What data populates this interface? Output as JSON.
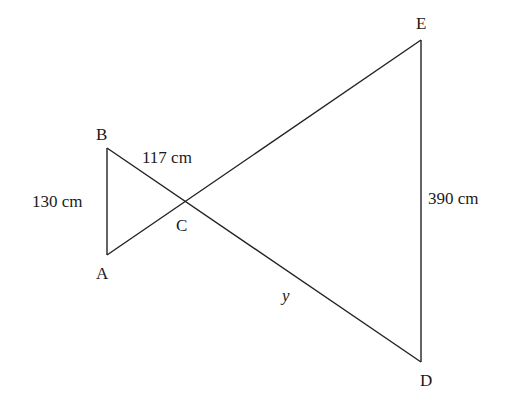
{
  "diagram": {
    "type": "similar-triangles",
    "points": {
      "A": {
        "label": "A",
        "x": 107,
        "y": 255
      },
      "B": {
        "label": "B",
        "x": 107,
        "y": 148
      },
      "C": {
        "label": "C",
        "x": 184,
        "y": 202
      },
      "D": {
        "label": "D",
        "x": 421,
        "y": 362
      },
      "E": {
        "label": "E",
        "x": 421,
        "y": 40
      }
    },
    "segments": [
      {
        "name": "AB",
        "from": "A",
        "to": "B"
      },
      {
        "name": "BD",
        "from": "B",
        "to": "D"
      },
      {
        "name": "AE",
        "from": "A",
        "to": "E"
      },
      {
        "name": "ED",
        "from": "E",
        "to": "D"
      }
    ],
    "measurements": {
      "AB": "130 cm",
      "BC": "117 cm",
      "ED": "390 cm",
      "CD": "y"
    }
  }
}
